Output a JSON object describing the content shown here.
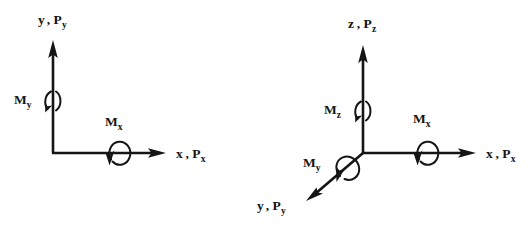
{
  "figure": {
    "background_color": "#ffffff",
    "ink_color": "#151515",
    "diagrams": [
      {
        "id": "two-dimensional-axes",
        "name": "2D coordinate system with moments",
        "origin": {
          "x": 53,
          "y": 153
        },
        "axes": [
          {
            "id": "y-axis-2d",
            "label_base": "y",
            "label_separator": ",",
            "label_force": "P",
            "label_force_subscript": "y",
            "label_full": "y , Py",
            "label_x": 38,
            "label_y": 24,
            "tip": {
              "x": 53,
              "y": 42
            }
          },
          {
            "id": "x-axis-2d",
            "label_base": "x",
            "label_separator": ",",
            "label_force": "P",
            "label_force_subscript": "x",
            "label_full": "x , Px",
            "label_x": 176,
            "label_y": 158,
            "tip": {
              "x": 165,
              "y": 153
            }
          }
        ],
        "moments": [
          {
            "id": "moment-y-2d",
            "symbol": "M",
            "subscript": "y",
            "label_full": "My",
            "label_x": 14,
            "label_y": 104,
            "style": "split-arc",
            "center": {
              "x": 53,
              "y": 100
            }
          },
          {
            "id": "moment-x-2d",
            "symbol": "M",
            "subscript": "x",
            "label_full": "Mx",
            "label_x": 105,
            "label_y": 126,
            "style": "loop-arc",
            "center": {
              "x": 117,
              "y": 152
            }
          }
        ]
      },
      {
        "id": "three-dimensional-axes",
        "name": "3D coordinate system with moments",
        "origin": {
          "x": 363,
          "y": 153
        },
        "axes": [
          {
            "id": "z-axis-3d",
            "label_base": "z",
            "label_separator": ",",
            "label_force": "P",
            "label_force_subscript": "z",
            "label_full": "z , Pz",
            "label_x": 348,
            "label_y": 28,
            "tip": {
              "x": 363,
              "y": 47
            }
          },
          {
            "id": "x-axis-3d",
            "label_base": "x",
            "label_separator": ",",
            "label_force": "P",
            "label_force_subscript": "x",
            "label_full": "x , Px",
            "label_x": 486,
            "label_y": 158,
            "tip": {
              "x": 475,
              "y": 153
            }
          },
          {
            "id": "y-axis-3d",
            "label_base": "y",
            "label_separator": ",",
            "label_force": "P",
            "label_force_subscript": "y",
            "label_full": "y , Py",
            "label_x": 257,
            "label_y": 210,
            "tip": {
              "x": 308,
              "y": 200
            }
          }
        ],
        "moments": [
          {
            "id": "moment-z-3d",
            "symbol": "M",
            "subscript": "z",
            "label_full": "Mz",
            "label_x": 324,
            "label_y": 114,
            "style": "split-arc",
            "center": {
              "x": 363,
              "y": 110
            }
          },
          {
            "id": "moment-x-3d",
            "symbol": "M",
            "subscript": "x",
            "label_full": "Mx",
            "label_x": 413,
            "label_y": 123,
            "style": "loop-arc",
            "center": {
              "x": 425,
              "y": 152
            }
          },
          {
            "id": "moment-y-3d",
            "symbol": "M",
            "subscript": "y",
            "label_full": "My",
            "label_x": 303,
            "label_y": 167,
            "style": "diagonal-arc",
            "center": {
              "x": 344,
              "y": 168
            }
          }
        ]
      }
    ]
  }
}
